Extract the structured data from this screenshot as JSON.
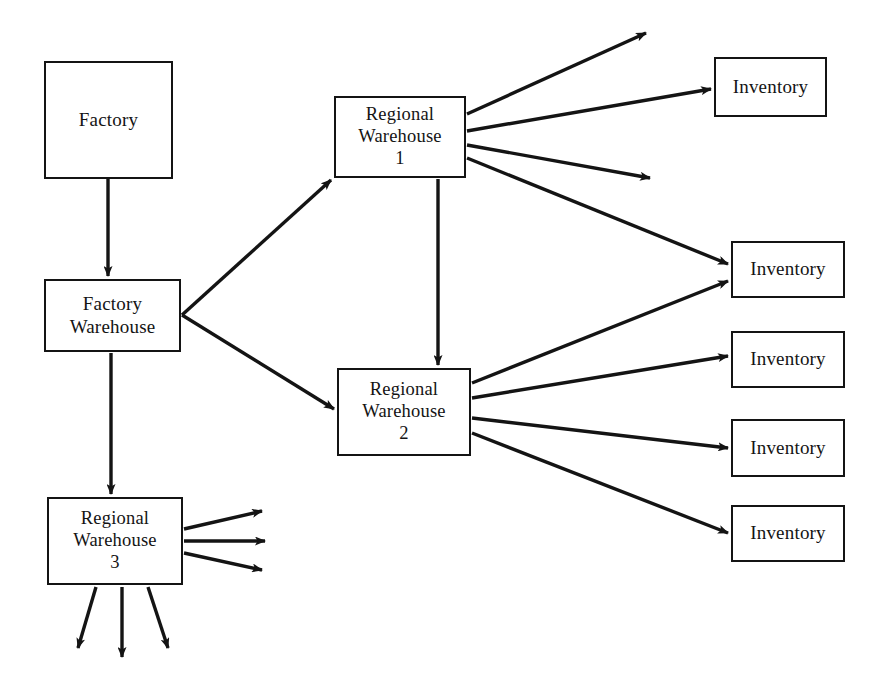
{
  "diagram": {
    "type": "flow-diagram",
    "canvas": {
      "width": 892,
      "height": 686
    },
    "colors": {
      "background": "#ffffff",
      "stroke": "#141414",
      "text": "#141414"
    },
    "nodes": [
      {
        "id": "factory",
        "label": "Factory",
        "x": 44,
        "y": 61,
        "w": 129,
        "h": 118
      },
      {
        "id": "factory-warehouse",
        "label": "Factory\nWarehouse",
        "x": 44,
        "y": 279,
        "w": 137,
        "h": 73
      },
      {
        "id": "regional-warehouse-1",
        "label": "Regional\nWarehouse\n1",
        "x": 334,
        "y": 96,
        "w": 132,
        "h": 82
      },
      {
        "id": "regional-warehouse-2",
        "label": "Regional\nWarehouse\n2",
        "x": 337,
        "y": 368,
        "w": 134,
        "h": 88
      },
      {
        "id": "regional-warehouse-3",
        "label": "Regional\nWarehouse\n3",
        "x": 47,
        "y": 497,
        "w": 136,
        "h": 88
      },
      {
        "id": "inventory-1",
        "label": "Inventory",
        "x": 714,
        "y": 57,
        "w": 113,
        "h": 60
      },
      {
        "id": "inventory-2",
        "label": "Inventory",
        "x": 731,
        "y": 241,
        "w": 114,
        "h": 57
      },
      {
        "id": "inventory-3",
        "label": "Inventory",
        "x": 731,
        "y": 419,
        "w": 114,
        "h": 58
      },
      {
        "id": "inventory-4",
        "label": "Inventory",
        "x": 731,
        "y": 505,
        "w": 114,
        "h": 57
      },
      {
        "id": "inventory-5",
        "label": "Inventory",
        "x": 731,
        "y": 331,
        "w": 114,
        "h": 57
      }
    ],
    "edges": [
      {
        "id": "factory-to-factory-warehouse",
        "from": "factory",
        "to": "factory-warehouse",
        "points": "108,179 108,276"
      },
      {
        "id": "factory-warehouse-to-rw1",
        "from": "factory-warehouse",
        "to": "regional-warehouse-1",
        "points": "182,315 331,180"
      },
      {
        "id": "factory-warehouse-to-rw2",
        "from": "factory-warehouse",
        "to": "regional-warehouse-2",
        "points": "182,315 334,409"
      },
      {
        "id": "factory-warehouse-to-rw3",
        "from": "factory-warehouse",
        "to": "regional-warehouse-3",
        "points": "111,353 111,494"
      },
      {
        "id": "rw1-to-rw2",
        "from": "regional-warehouse-1",
        "to": "regional-warehouse-2",
        "points": "438,179 438,365"
      },
      {
        "id": "rw1-out-a",
        "from": "regional-warehouse-1",
        "to": "external",
        "points": "467,114 646,33"
      },
      {
        "id": "rw1-to-inventory-1",
        "from": "regional-warehouse-1",
        "to": "inventory-1",
        "points": "467,131 711,89"
      },
      {
        "id": "rw1-out-b",
        "from": "regional-warehouse-1",
        "to": "external",
        "points": "467,145 650,178"
      },
      {
        "id": "rw1-to-inventory-2",
        "from": "regional-warehouse-1",
        "to": "inventory-2",
        "points": "467,158 728,264"
      },
      {
        "id": "rw2-to-inventory-2",
        "from": "regional-warehouse-2",
        "to": "inventory-2",
        "points": "472,383 728,281"
      },
      {
        "id": "rw2-to-inventory-5",
        "from": "regional-warehouse-2",
        "to": "inventory-5",
        "points": "472,398 728,356"
      },
      {
        "id": "rw2-to-inventory-3",
        "from": "regional-warehouse-2",
        "to": "inventory-3",
        "points": "472,418 728,448"
      },
      {
        "id": "rw2-to-inventory-4",
        "from": "regional-warehouse-2",
        "to": "inventory-4",
        "points": "472,433 728,533"
      },
      {
        "id": "rw3-out-right-a",
        "from": "regional-warehouse-3",
        "to": "external",
        "points": "184,529 262,511"
      },
      {
        "id": "rw3-out-right-b",
        "from": "regional-warehouse-3",
        "to": "external",
        "points": "184,541 265,541"
      },
      {
        "id": "rw3-out-right-c",
        "from": "regional-warehouse-3",
        "to": "external",
        "points": "184,553 262,570"
      },
      {
        "id": "rw3-out-down-a",
        "from": "regional-warehouse-3",
        "to": "external",
        "points": "96,587 78,648"
      },
      {
        "id": "rw3-out-down-b",
        "from": "regional-warehouse-3",
        "to": "external",
        "points": "122,587 122,657"
      },
      {
        "id": "rw3-out-down-c",
        "from": "regional-warehouse-3",
        "to": "external",
        "points": "148,587 168,648"
      }
    ]
  }
}
